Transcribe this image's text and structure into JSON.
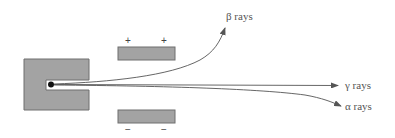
{
  "diagram": {
    "title": "",
    "colors": {
      "block_fill": "#a3a3a3",
      "block_stroke": "#6f6f6f",
      "beam": "#555555",
      "source_dot": "#111111",
      "text": "#555555"
    },
    "source": {
      "label": "",
      "description": "radioactive source in lead block"
    },
    "plates": {
      "top": {
        "charge_signs": [
          "+",
          "+"
        ]
      },
      "bottom": {
        "charge_signs": [
          "−",
          "−"
        ]
      }
    },
    "rays": [
      {
        "id": "beta",
        "label": "β rays"
      },
      {
        "id": "gamma",
        "label": "γ rays"
      },
      {
        "id": "alpha",
        "label": "α rays"
      }
    ]
  }
}
